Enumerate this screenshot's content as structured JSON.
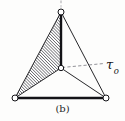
{
  "figure": {
    "caption": "(b)",
    "label_tau": "τ",
    "label_tau_subscript": "o",
    "label_tau_full": "τo",
    "background_color": "#fdfdfc",
    "line_color": "#1b1b1f",
    "hatch_color": "#2b2b30",
    "node_fill": "#ffffff"
  },
  "geometry": {
    "nodes": [
      {
        "name": "apex-node",
        "x": 61,
        "y": 12,
        "r": 3.0
      },
      {
        "name": "center-node",
        "x": 61,
        "y": 68,
        "r": 2.8
      },
      {
        "name": "bottom-left-node",
        "x": 15,
        "y": 98,
        "r": 3.0
      },
      {
        "name": "bottom-right-node",
        "x": 106,
        "y": 98,
        "r": 3.0
      }
    ],
    "edges": [
      {
        "name": "edge-apex-to-bottom-left",
        "from": "apex-node",
        "to": "bottom-left-node",
        "weight": "thin"
      },
      {
        "name": "edge-apex-to-bottom-right",
        "from": "apex-node",
        "to": "bottom-right-node",
        "weight": "thin"
      },
      {
        "name": "edge-apex-to-center",
        "from": "apex-node",
        "to": "center-node",
        "weight": "thick"
      },
      {
        "name": "edge-center-to-bottom-left",
        "from": "center-node",
        "to": "bottom-left-node",
        "weight": "thin"
      },
      {
        "name": "edge-center-to-bottom-right",
        "from": "center-node",
        "to": "bottom-right-node",
        "weight": "thin"
      },
      {
        "name": "edge-bottom-base",
        "from": "bottom-left-node",
        "to": "bottom-right-node",
        "weight": "thick"
      }
    ],
    "hatched_region": {
      "name": "hatched-face",
      "points": "61,12 61,68 15,98",
      "hatch_angle_deg": 45,
      "hatch_spacing_px": 2.2
    },
    "leader_line": {
      "name": "tau-leader-line",
      "x1": 61,
      "y1": 68,
      "x2": 104,
      "y2": 64,
      "dash": "3,2"
    },
    "top_stub": {
      "name": "cropped-top-mark",
      "x1": 61,
      "y1": 0,
      "x2": 61,
      "y2": 8
    }
  }
}
